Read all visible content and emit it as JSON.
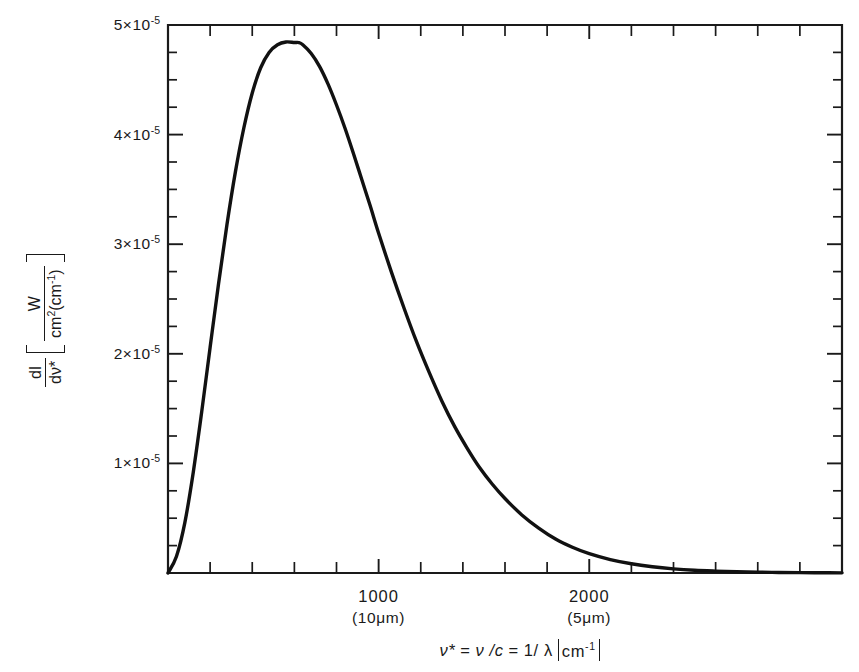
{
  "figure": {
    "background": "#ffffff",
    "ink_color": "#111111",
    "curve_color": "#111111"
  },
  "axes": {
    "x": {
      "label_parts": {
        "nu_star": "ν*",
        "eq1": "=",
        "nu_over_c": "ν /c",
        "eq2": "=",
        "one_over_lambda": "1/ λ",
        "unit": "cm",
        "unit_exp": "-1"
      },
      "label_plain": "ν* = ν /c = 1/ λ  [cm⁻¹]",
      "range": [
        0,
        3200
      ],
      "major_ticks": [
        {
          "value": 1000,
          "label": "1000",
          "sublabel": "(10μm)"
        },
        {
          "value": 2000,
          "label": "2000",
          "sublabel": "(5μm)"
        }
      ],
      "minor_tick_step": 200,
      "grid": false
    },
    "y": {
      "label_parts": {
        "numerator": "dI",
        "denominator": "dν*",
        "unit_numerator": "W",
        "unit_denominator_main": "cm",
        "unit_denominator_exp": "2",
        "unit_denominator_paren": "(cm",
        "unit_denominator_paren_exp": "-1",
        "unit_denominator_close": ")"
      },
      "label_plain": "dI/dν*  [ W / cm² (cm⁻¹) ]",
      "range": [
        0,
        5e-05
      ],
      "tick_labels": [
        {
          "value": 5e-05,
          "text": "5×10",
          "exp": "-5"
        },
        {
          "value": 4e-05,
          "text": "4×10",
          "exp": "-5"
        },
        {
          "value": 3e-05,
          "text": "3×10",
          "exp": "-5"
        },
        {
          "value": 2e-05,
          "text": "2×10",
          "exp": "-5"
        },
        {
          "value": 1e-05,
          "text": "1×10",
          "exp": "-5"
        }
      ],
      "minor_tick_step": 2.5e-06,
      "grid": false
    }
  },
  "chart_data": {
    "type": "line",
    "title": "",
    "subtitle": "",
    "xlabel": "ν* = ν /c = 1/λ  [cm⁻¹]",
    "ylabel": "dI/dν*  [ W / cm² (cm⁻¹) ]",
    "xlim": [
      0,
      3200
    ],
    "ylim": [
      0,
      5e-05
    ],
    "grid": false,
    "legend": null,
    "annotations": [],
    "peak": {
      "x": 620,
      "y": 4.84e-05
    },
    "series": [
      {
        "name": "blackbody spectral radiance (T ≈ 300 K)",
        "x": [
          0,
          40,
          80,
          120,
          160,
          200,
          240,
          280,
          320,
          360,
          400,
          440,
          480,
          520,
          560,
          600,
          620,
          640,
          680,
          720,
          760,
          800,
          840,
          880,
          920,
          960,
          1000,
          1060,
          1120,
          1180,
          1240,
          1300,
          1360,
          1420,
          1480,
          1540,
          1600,
          1680,
          1760,
          1840,
          1920,
          2000,
          2100,
          2200,
          2300,
          2400,
          2500,
          2600,
          2700,
          2800,
          2900,
          3000,
          3100,
          3200
        ],
        "y": [
          0.0,
          1.5e-06,
          4.6e-06,
          9.2e-06,
          1.47e-05,
          2.06e-05,
          2.64e-05,
          3.18e-05,
          3.66e-05,
          4.06e-05,
          4.38e-05,
          4.61e-05,
          4.75e-05,
          4.82e-05,
          4.845e-05,
          4.84e-05,
          4.84e-05,
          4.82e-05,
          4.74e-05,
          4.62e-05,
          4.46e-05,
          4.27e-05,
          4.06e-05,
          3.83e-05,
          3.59e-05,
          3.35e-05,
          3.1e-05,
          2.75e-05,
          2.42e-05,
          2.11e-05,
          1.83e-05,
          1.57e-05,
          1.34e-05,
          1.14e-05,
          9.6e-06,
          8.1e-06,
          6.8e-06,
          5.3e-06,
          4.1e-06,
          3.1e-06,
          2.35e-06,
          1.76e-06,
          1.22e-06,
          8.4e-07,
          5.7e-07,
          3.8e-07,
          2.5e-07,
          1.7e-07,
          1.1e-07,
          7e-08,
          5e-08,
          3e-08,
          2e-08,
          1.3e-08
        ]
      }
    ]
  },
  "plot_geometry": {
    "left_px": 168,
    "right_px": 842,
    "top_px": 25,
    "bottom_px": 573
  }
}
